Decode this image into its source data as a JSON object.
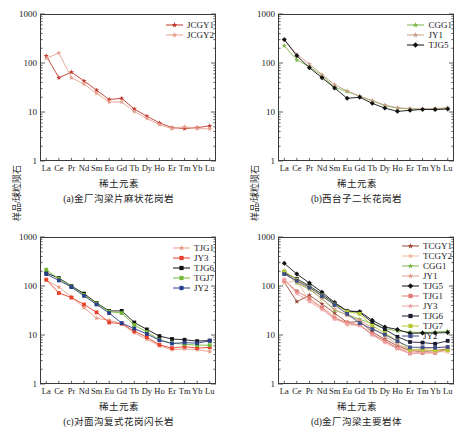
{
  "figure": {
    "axis_x_title": "稀土元素",
    "axis_y_title": "样品/球粒陨石",
    "elements": [
      "La",
      "Ce",
      "Pr",
      "Nd",
      "Sm",
      "Eu",
      "Gd",
      "Tb",
      "Dy",
      "Ho",
      "Er",
      "Tm",
      "Yb",
      "Lu"
    ],
    "yticks": [
      "1000",
      "100",
      "10",
      "1"
    ]
  },
  "chart_data": [
    {
      "type": "line",
      "panel": "a",
      "title": "(a)金厂沟梁片麻状花岗岩",
      "xlabel": "稀土元素",
      "ylabel": "样品/球粒陨石",
      "x": [
        "La",
        "Ce",
        "Pr",
        "Nd",
        "Sm",
        "Eu",
        "Gd",
        "Tb",
        "Dy",
        "Ho",
        "Er",
        "Tm",
        "Yb",
        "Lu"
      ],
      "yscale": "log",
      "ylim": [
        1,
        1000
      ],
      "grid": false,
      "legend_position": "top-right",
      "series": [
        {
          "name": "JCGY1",
          "color": "#c0392b",
          "marker": "star",
          "values": [
            140,
            50,
            65,
            43,
            28,
            18,
            19,
            11.5,
            8.2,
            6.0,
            4.8,
            4.6,
            4.8,
            5.2
          ]
        },
        {
          "name": "JCGY2",
          "color": "#e8a090",
          "marker": "star",
          "values": [
            125,
            160,
            50,
            37,
            24,
            16,
            16,
            10.2,
            7.4,
            5.5,
            4.6,
            5.0,
            4.6,
            4.5
          ]
        }
      ]
    },
    {
      "type": "line",
      "panel": "b",
      "title": "(b)西台子二长花岗岩",
      "xlabel": "稀土元素",
      "ylabel": "样品/球粒陨石",
      "x": [
        "La",
        "Ce",
        "Pr",
        "Nd",
        "Sm",
        "Eu",
        "Gd",
        "Tb",
        "Dy",
        "Ho",
        "Er",
        "Tm",
        "Yb",
        "Lu"
      ],
      "yscale": "log",
      "ylim": [
        1,
        1000
      ],
      "grid": false,
      "legend_position": "top-right",
      "series": [
        {
          "name": "CGG1",
          "color": "#7db84a",
          "marker": "star",
          "values": [
            225,
            115,
            85,
            55,
            32,
            26,
            21,
            17,
            13.5,
            12.0,
            11.5,
            11.2,
            11.5,
            12.0
          ]
        },
        {
          "name": "JY1",
          "color": "#c9a08c",
          "marker": "star",
          "values": [
            300,
            150,
            95,
            58,
            36,
            27,
            21,
            17,
            13.8,
            12.2,
            11.8,
            11.6,
            11.8,
            12.2
          ]
        },
        {
          "name": "TJG5",
          "color": "#111111",
          "marker": "diamond",
          "values": [
            300,
            140,
            80,
            50,
            31,
            19,
            20,
            15,
            12.0,
            10.3,
            10.8,
            11.3,
            11.2,
            11.5
          ]
        }
      ]
    },
    {
      "type": "line",
      "panel": "c",
      "title": "(c)对面沟复式花岗闪长岩",
      "xlabel": "稀土元素",
      "ylabel": "样品/球粒陨石",
      "x": [
        "La",
        "Ce",
        "Pr",
        "Nd",
        "Sm",
        "Eu",
        "Gd",
        "Tb",
        "Dy",
        "Ho",
        "Er",
        "Tm",
        "Yb",
        "Lu"
      ],
      "yscale": "log",
      "ylim": [
        1,
        1000
      ],
      "grid": false,
      "legend_position": "top-right",
      "series": [
        {
          "name": "TJG1",
          "color": "#e99a85",
          "marker": "star",
          "values": [
            130,
            95,
            60,
            36,
            22,
            20,
            17,
            11.0,
            8.2,
            6.0,
            5.0,
            5.2,
            5.0,
            4.6
          ]
        },
        {
          "name": "JY3",
          "color": "#e8402a",
          "marker": "square",
          "values": [
            135,
            72,
            58,
            42,
            29,
            18,
            17,
            12.0,
            9.0,
            6.3,
            5.4,
            5.8,
            5.4,
            5.6
          ]
        },
        {
          "name": "TJG6",
          "color": "#111111",
          "marker": "square",
          "values": [
            185,
            145,
            100,
            70,
            45,
            31,
            31,
            18,
            13.0,
            9.5,
            8.3,
            8.0,
            7.5,
            7.7
          ]
        },
        {
          "name": "TGJ7",
          "color": "#74b83a",
          "marker": "square",
          "values": [
            215,
            140,
            98,
            66,
            44,
            30,
            28,
            16,
            11.5,
            8.0,
            6.8,
            6.5,
            6.2,
            6.2
          ]
        },
        {
          "name": "JY2",
          "color": "#2c3f8c",
          "marker": "square",
          "values": [
            175,
            130,
            95,
            63,
            42,
            28,
            17.5,
            13.5,
            10.5,
            7.8,
            6.7,
            7.0,
            6.8,
            7.6
          ]
        }
      ]
    },
    {
      "type": "line",
      "panel": "d",
      "title": "(d)金厂沟梁主要岩体",
      "xlabel": "稀土元素",
      "ylabel": "样品/球粒陨石",
      "x": [
        "La",
        "Ce",
        "Pr",
        "Nd",
        "Sm",
        "Eu",
        "Gd",
        "Tb",
        "Dy",
        "Ho",
        "Er",
        "Tm",
        "Yb",
        "Lu"
      ],
      "yscale": "log",
      "ylim": [
        1,
        1000
      ],
      "grid": false,
      "legend_position": "top-right",
      "series": [
        {
          "name": "TCGY1",
          "color": "#9c4a3a",
          "marker": "star",
          "values": [
            120,
            48,
            65,
            43,
            28,
            18,
            19,
            11.5,
            8.2,
            6.0,
            4.8,
            4.6,
            4.8,
            5.2
          ]
        },
        {
          "name": "TCGY2",
          "color": "#f0b8a0",
          "marker": "star",
          "values": [
            115,
            130,
            50,
            37,
            24,
            16,
            16,
            10.2,
            7.4,
            5.5,
            4.6,
            5.0,
            4.6,
            4.5
          ]
        },
        {
          "name": "CGG1",
          "color": "#7db84a",
          "marker": "star",
          "values": [
            200,
            115,
            85,
            55,
            32,
            26,
            21,
            17,
            13.5,
            12.0,
            11.5,
            11.2,
            11.5,
            12.0
          ]
        },
        {
          "name": "JY1",
          "color": "#dfa188",
          "marker": "star",
          "values": [
            190,
            120,
            88,
            55,
            34,
            25,
            20,
            14,
            9.5,
            6.5,
            5.0,
            5.2,
            5.5,
            5.8
          ]
        },
        {
          "name": "TJG5",
          "color": "#111111",
          "marker": "diamond",
          "values": [
            290,
            175,
            115,
            75,
            46,
            31,
            30,
            20,
            14.5,
            13.0,
            10.8,
            11.0,
            11.0,
            11.2
          ]
        },
        {
          "name": "TJG1",
          "color": "#e07a72",
          "marker": "square",
          "values": [
            130,
            78,
            56,
            36,
            22,
            18,
            16,
            10.5,
            7.6,
            5.4,
            4.2,
            4.3,
            4.3,
            5.2
          ]
        },
        {
          "name": "JY3",
          "color": "#efa3a6",
          "marker": "star",
          "values": [
            135,
            70,
            48,
            33,
            21,
            17,
            15.5,
            10.0,
            7.0,
            5.2,
            4.2,
            4.5,
            4.4,
            5.0
          ]
        },
        {
          "name": "TJG6",
          "color": "#1a1a2e",
          "marker": "square",
          "values": [
            185,
            140,
            100,
            68,
            44,
            31,
            29,
            18,
            13.0,
            9.2,
            7.2,
            7.0,
            6.6,
            7.6
          ]
        },
        {
          "name": "TJG7",
          "color": "#b8c832",
          "marker": "square",
          "values": [
            200,
            135,
            95,
            64,
            42,
            30,
            27,
            15.5,
            11.0,
            7.6,
            5.0,
            5.0,
            4.8,
            4.9
          ]
        },
        {
          "name": "JY2",
          "color": "#3f4f8a",
          "marker": "square",
          "values": [
            175,
            128,
            93,
            62,
            41,
            27,
            17.5,
            13.2,
            10.2,
            7.5,
            5.6,
            5.6,
            5.5,
            5.7
          ]
        }
      ]
    }
  ]
}
